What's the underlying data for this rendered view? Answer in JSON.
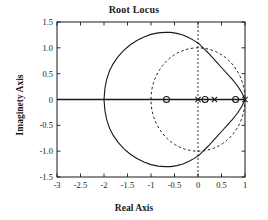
{
  "chart_data": {
    "type": "line",
    "title": "Root Locus",
    "xlabel": "Real Axis",
    "ylabel": "Imaginety Axis",
    "xlim": [
      -3,
      1
    ],
    "ylim": [
      -1.5,
      1.5
    ],
    "grid": false,
    "legend": null,
    "xticks": [
      -3,
      -2.5,
      -2,
      -1.5,
      -1,
      -0.5,
      0,
      0.5,
      1
    ],
    "xticklabels": [
      "-3",
      "-2.5",
      "-2",
      "-1.5",
      "-1",
      "-0.5",
      "0",
      "0.5",
      "1"
    ],
    "yticks": [
      1.5,
      1.0,
      0.5,
      0,
      -0.5,
      -1.0,
      -1.5
    ],
    "yticklabels": [
      "1.5",
      "1.0",
      "0.5",
      "0",
      "-0.5",
      "-1.0",
      "-1.5"
    ],
    "annotations": {
      "unit_circle": {
        "style": "dashed",
        "center": [
          0,
          0
        ],
        "radius": 1.0
      },
      "imaginary_axis_line": {
        "style": "dashed",
        "x": 0
      },
      "real_axis_line": {
        "style": "solid",
        "y": 0
      }
    },
    "series": [
      {
        "name": "root-locus-branch-upper",
        "style": "solid",
        "x": [
          -2.0,
          -1.98,
          -1.94,
          -1.88,
          -1.8,
          -1.7,
          -1.58,
          -1.44,
          -1.3,
          -1.15,
          -1.0,
          -0.85,
          -0.7,
          -0.58,
          -0.45,
          -0.32,
          -0.2,
          -0.08,
          0.02,
          0.12,
          0.22,
          0.32,
          0.42,
          0.52,
          0.6,
          0.68,
          0.74,
          0.8,
          0.85,
          0.9,
          0.94,
          0.97,
          1.0
        ],
        "y": [
          0.0,
          0.22,
          0.4,
          0.56,
          0.7,
          0.83,
          0.95,
          1.06,
          1.14,
          1.21,
          1.26,
          1.29,
          1.3,
          1.3,
          1.28,
          1.25,
          1.2,
          1.14,
          1.08,
          0.99,
          0.9,
          0.8,
          0.7,
          0.6,
          0.52,
          0.44,
          0.38,
          0.31,
          0.25,
          0.18,
          0.12,
          0.06,
          0.0
        ]
      },
      {
        "name": "root-locus-branch-lower",
        "style": "solid",
        "mirror_of": "root-locus-branch-upper"
      }
    ],
    "markers": {
      "zeros": {
        "symbol": "o",
        "points": [
          [
            -0.67,
            0.0
          ],
          [
            0.15,
            0.0
          ],
          [
            0.8,
            0.0
          ]
        ]
      },
      "poles": {
        "symbol": "x",
        "points": [
          [
            0.0,
            0.0
          ],
          [
            0.35,
            0.0
          ],
          [
            1.0,
            0.0
          ]
        ]
      }
    },
    "real_axis_segments_dotted": [
      [
        -1.0,
        0.15
      ],
      [
        0.15,
        0.35
      ]
    ],
    "colors": {
      "line": "#1a1a1a",
      "axis": "#1a1a1a",
      "background": "#ffffff"
    }
  }
}
